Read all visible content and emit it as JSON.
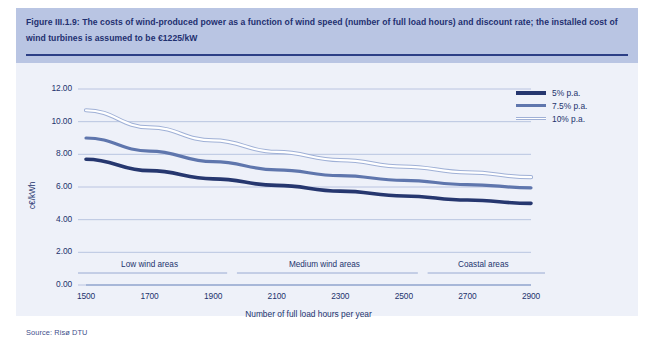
{
  "caption": {
    "text": "Figure III.1.9: The costs of wind-produced power as a function of wind speed (number of full load hours) and discount rate; the installed cost of wind turbines is assumed to be €1225/kW"
  },
  "source": {
    "text": "Source: Risø DTU"
  },
  "colors": {
    "caption_band": "#b9c5e3",
    "caption_text": "#1f3070",
    "panel_bg": "#eef1f9",
    "grid": "#b3c0de",
    "axis": "#8fa3cd",
    "series_5": "#26376f",
    "series_75": "#5f76ad",
    "series_10": "#ffffff",
    "series_10_edge": "#9fb0d6"
  },
  "legend": {
    "position": "top-right",
    "items": [
      {
        "label": "5% p.a.",
        "color": "#26376f",
        "style": "solid-thick"
      },
      {
        "label": "7.5% p.a.",
        "color": "#5f76ad",
        "style": "solid-medium"
      },
      {
        "label": "10% p.a.",
        "color": "#ffffff",
        "style": "hollow"
      }
    ]
  },
  "regions": [
    {
      "label": "Low wind areas",
      "from": 1500,
      "to": 1900
    },
    {
      "label": "Medium wind areas",
      "from": 2000,
      "to": 2500
    },
    {
      "label": "Coastal areas",
      "from": 2600,
      "to": 2900
    }
  ],
  "chart_data": {
    "type": "line",
    "title": "",
    "xlabel": "Number of full load hours per year",
    "ylabel": "c€/kWh",
    "xlim": [
      1500,
      2900
    ],
    "ylim": [
      0.0,
      12.0
    ],
    "ytick_labels": [
      "0.00",
      "2.00",
      "4.00",
      "6.00",
      "8.00",
      "10.00",
      "12.00"
    ],
    "yticks": [
      0.0,
      2.0,
      4.0,
      6.0,
      8.0,
      10.0,
      12.0
    ],
    "xtick_labels": [
      "1500",
      "1700",
      "1900",
      "2100",
      "2300",
      "2500",
      "2700",
      "2900"
    ],
    "xticks": [
      1500,
      1700,
      1900,
      2100,
      2300,
      2500,
      2700,
      2900
    ],
    "grid": "horizontal",
    "x": [
      1500,
      1700,
      1900,
      2100,
      2300,
      2500,
      2700,
      2900
    ],
    "series": [
      {
        "name": "5% p.a.",
        "color": "#26376f",
        "values": [
          7.7,
          7.0,
          6.5,
          6.1,
          5.75,
          5.45,
          5.2,
          5.0
        ]
      },
      {
        "name": "7.5% p.a.",
        "color": "#5f76ad",
        "values": [
          9.0,
          8.2,
          7.55,
          7.05,
          6.7,
          6.4,
          6.15,
          5.95
        ]
      },
      {
        "name": "10% p.a.",
        "color": "#ffffff",
        "values": [
          10.7,
          9.65,
          8.85,
          8.15,
          7.65,
          7.25,
          6.9,
          6.6
        ]
      }
    ]
  }
}
